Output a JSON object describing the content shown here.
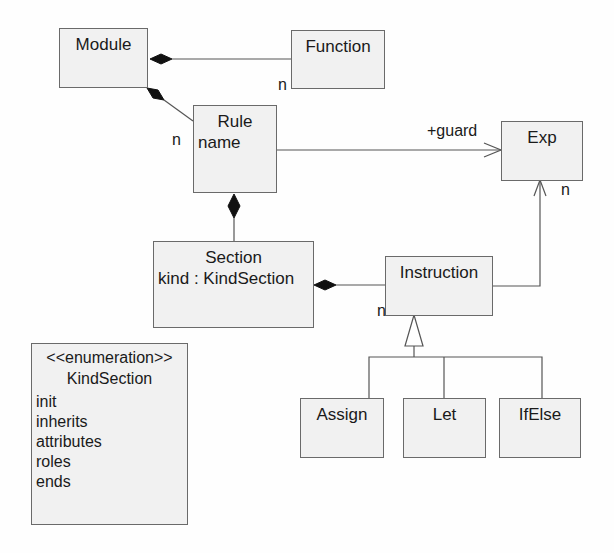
{
  "diagram": {
    "type": "UML class diagram",
    "classes": {
      "module": {
        "name": "Module"
      },
      "function": {
        "name": "Function"
      },
      "rule": {
        "name": "Rule",
        "attributes": [
          "name"
        ]
      },
      "exp": {
        "name": "Exp"
      },
      "section": {
        "name": "Section",
        "attributes": [
          "kind : KindSection"
        ]
      },
      "instruction": {
        "name": "Instruction"
      },
      "assign": {
        "name": "Assign"
      },
      "let": {
        "name": "Let"
      },
      "ifelse": {
        "name": "IfElse"
      }
    },
    "enumeration": {
      "stereotype": "<<enumeration>>",
      "name": "KindSection",
      "literals": [
        "init",
        "inherits",
        "attributes",
        "roles",
        "ends"
      ]
    },
    "associations": [
      {
        "from": "Module",
        "to": "Function",
        "kind": "composition",
        "multiplicity": "n"
      },
      {
        "from": "Module",
        "to": "Rule",
        "kind": "composition",
        "multiplicity": "n"
      },
      {
        "from": "Rule",
        "to": "Exp",
        "kind": "directed",
        "role": "+guard"
      },
      {
        "from": "Rule",
        "to": "Section",
        "kind": "composition"
      },
      {
        "from": "Section",
        "to": "Instruction",
        "kind": "composition",
        "multiplicity": "n"
      },
      {
        "from": "Instruction",
        "to": "Exp",
        "kind": "directed",
        "multiplicity": "n"
      },
      {
        "from": "Assign",
        "to": "Instruction",
        "kind": "generalization"
      },
      {
        "from": "Let",
        "to": "Instruction",
        "kind": "generalization"
      },
      {
        "from": "IfElse",
        "to": "Instruction",
        "kind": "generalization"
      }
    ],
    "labels": {
      "function_mult": "n",
      "rule_mult": "n",
      "guard_role": "+guard",
      "exp_mult": "n",
      "instruction_mult": "n"
    }
  }
}
